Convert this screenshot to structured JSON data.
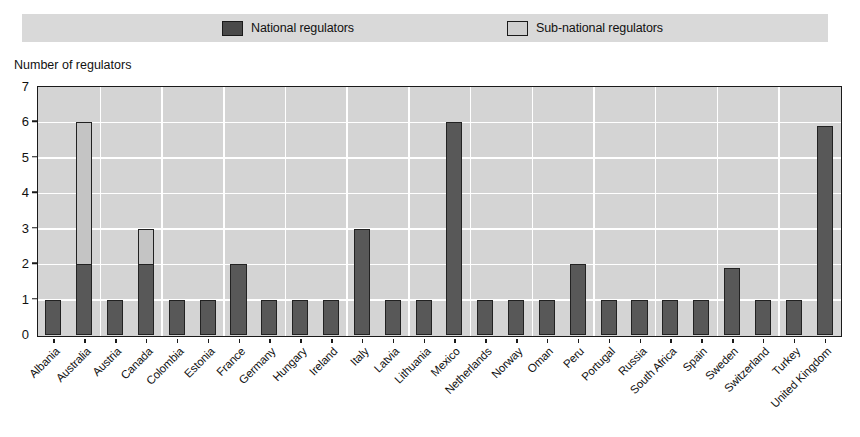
{
  "legend": {
    "entries": [
      {
        "label": "National regulators",
        "icon": "square-swatch-dark",
        "color": "#4a4a4a"
      },
      {
        "label": "Sub-national regulators",
        "icon": "square-swatch-light",
        "color": "#cfcfcf"
      }
    ]
  },
  "axis": {
    "y_title": "Number of regulators",
    "y_ticks": [
      "0",
      "1",
      "2",
      "3",
      "4",
      "5",
      "6",
      "7"
    ]
  },
  "chart_data": {
    "type": "bar",
    "title": "",
    "subtitle": "",
    "xlabel": "",
    "ylabel": "Number of regulators",
    "ylim": [
      0,
      7
    ],
    "ytick_step": 1,
    "grid": true,
    "stacked": true,
    "legend_position": "top",
    "colors": {
      "national": "#585858",
      "subnational": "#c4c4c4",
      "plot_background": "#d4d4d4",
      "gridline": "#ffffff",
      "axis": "#1a1a1a"
    },
    "categories": [
      "Albania",
      "Australia",
      "Austria",
      "Canada",
      "Colombia",
      "Estonia",
      "France",
      "Germany",
      "Hungary",
      "Ireland",
      "Italy",
      "Latvia",
      "Lithuania",
      "Mexico",
      "Netherlands",
      "Norway",
      "Oman",
      "Peru",
      "Portugal",
      "Russia",
      "South Africa",
      "Spain",
      "Sweden",
      "Switzerland",
      "Turkey",
      "United Kingdom"
    ],
    "series": [
      {
        "name": "National regulators",
        "values": [
          1,
          2,
          1,
          2,
          1,
          1,
          2,
          1,
          1,
          1,
          3,
          1,
          1,
          6,
          1,
          1,
          1,
          2,
          1,
          1,
          1,
          1,
          1.9,
          1,
          1,
          5.9
        ]
      },
      {
        "name": "Sub-national regulators",
        "values": [
          0,
          4,
          0,
          1,
          0,
          0,
          0,
          0,
          0,
          0,
          0,
          0,
          0,
          0,
          0,
          0,
          0,
          0,
          0,
          0,
          0,
          0,
          0,
          0,
          0,
          0
        ]
      }
    ],
    "totals": [
      1,
      6,
      1,
      3,
      1,
      1,
      2,
      1,
      1,
      1,
      3,
      1,
      1,
      6,
      1,
      1,
      1,
      2,
      1,
      1,
      1,
      1,
      1.9,
      1,
      1,
      5.9
    ]
  }
}
